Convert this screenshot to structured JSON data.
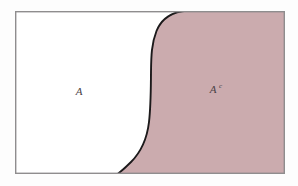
{
  "figure": {
    "type": "set-complement-venn-diagram",
    "regions": [
      {
        "id": "set-a",
        "label": "A",
        "superscript": "",
        "fill": "#ffffff",
        "position": "left",
        "label_x": 79,
        "label_y": 95
      },
      {
        "id": "set-a-complement",
        "label": "A",
        "superscript": "c",
        "fill": "#cdadb0",
        "position": "right",
        "label_x": 213,
        "label_y": 93
      }
    ],
    "frame": {
      "x": 15,
      "y": 11,
      "width": 270,
      "height": 163,
      "stroke": "#8f8d8e",
      "stroke_width": 1.4,
      "fill": "#ffffff"
    },
    "divider": {
      "stroke": "#1c1a1b",
      "stroke_width": 1.8,
      "shape": "s-curve",
      "top_x": 188,
      "bottom_x": 117
    },
    "colors": {
      "shaded_region": "#cdadb0",
      "unshaded_region": "#ffffff",
      "frame_border": "#8f8d8e",
      "curve_line": "#1c1a1b",
      "label_text": "#4a4247",
      "page_background": "#fdfdfd"
    }
  }
}
